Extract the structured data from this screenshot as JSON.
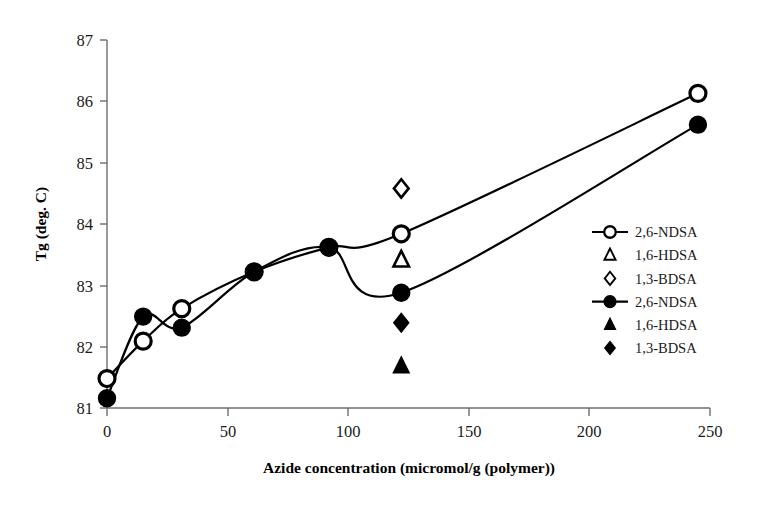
{
  "chart_data": {
    "type": "line",
    "title": "",
    "xlabel": "Azide concentration (micromol/g (polymer))",
    "ylabel": "Tg (deg. C)",
    "xlim": [
      0,
      250
    ],
    "ylim": [
      81,
      87
    ],
    "xticks": [
      0,
      50,
      100,
      150,
      200,
      250
    ],
    "xtick_labels": [
      "0",
      "50",
      "100",
      "150",
      "200",
      "250"
    ],
    "yticks": [
      81,
      82,
      83,
      84,
      85,
      86,
      87
    ],
    "ytick_labels": [
      "81",
      "82",
      "83",
      "84",
      "85",
      "86",
      "87"
    ],
    "grid": false,
    "legend_position": "right",
    "series": [
      {
        "name": "2,6-NDSA",
        "marker": "open-circle",
        "line": true,
        "x": [
          0,
          15,
          31,
          61,
          92,
          122,
          245
        ],
        "y": [
          81.48,
          82.09,
          82.62,
          83.22,
          83.62,
          83.84,
          86.13
        ]
      },
      {
        "name": "1,6-HDSA",
        "marker": "open-triangle",
        "line": false,
        "x": [
          122
        ],
        "y": [
          83.41
        ]
      },
      {
        "name": "1,3-BDSA",
        "marker": "open-diamond",
        "line": false,
        "x": [
          122
        ],
        "y": [
          84.58
        ]
      },
      {
        "name": "2,6-NDSA",
        "marker": "filled-circle",
        "line": true,
        "x": [
          0,
          15,
          31,
          61,
          92,
          122,
          245
        ],
        "y": [
          81.16,
          82.49,
          82.31,
          83.22,
          83.62,
          82.88,
          85.62
        ]
      },
      {
        "name": "1,6-HDSA",
        "marker": "filled-triangle",
        "line": false,
        "x": [
          122
        ],
        "y": [
          81.68
        ]
      },
      {
        "name": "1,3-BDSA",
        "marker": "filled-diamond",
        "line": false,
        "x": [
          122
        ],
        "y": [
          82.39
        ]
      }
    ]
  },
  "axes": {
    "y_title": "Tg (deg. C)",
    "x_title": "Azide concentration (micromol/g (polymer))",
    "y_tick_87": "87",
    "y_tick_86": "86",
    "y_tick_85": "85",
    "y_tick_84": "84",
    "y_tick_83": "83",
    "y_tick_82": "82",
    "y_tick_81": "81",
    "x_tick_0": "0",
    "x_tick_50": "50",
    "x_tick_100": "100",
    "x_tick_150": "150",
    "x_tick_200": "200",
    "x_tick_250": "250"
  },
  "legend": {
    "entries": [
      {
        "label": "2,6-NDSA",
        "marker": "open-circle",
        "has_line": true
      },
      {
        "label": "1,6-HDSA",
        "marker": "open-triangle",
        "has_line": false
      },
      {
        "label": "1,3-BDSA",
        "marker": "open-diamond",
        "has_line": false
      },
      {
        "label": "2,6-NDSA",
        "marker": "filled-circle",
        "has_line": true
      },
      {
        "label": "1,6-HDSA",
        "marker": "filled-triangle",
        "has_line": false
      },
      {
        "label": "1,3-BDSA",
        "marker": "filled-diamond",
        "has_line": false
      }
    ]
  },
  "style": {
    "line_color": "#000000",
    "marker_fill_open": "#ffffff",
    "marker_fill_closed": "#000000",
    "axis_color": "#6e6e6e",
    "background": "#ffffff"
  }
}
